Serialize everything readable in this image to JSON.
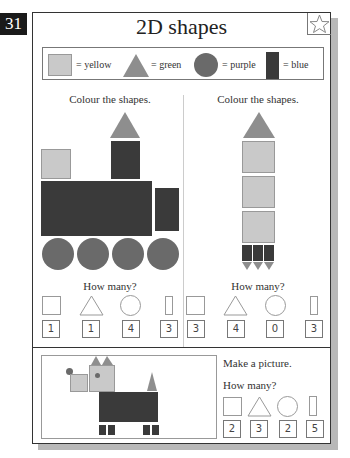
{
  "page_number": "31",
  "title": "2D shapes",
  "star_icon": "star-outline-icon",
  "key": {
    "items": [
      {
        "shape": "square",
        "label": "= yellow",
        "color": "#c9c9c9"
      },
      {
        "shape": "triangle",
        "label": "= green",
        "color": "#8e8e8e"
      },
      {
        "shape": "circle",
        "label": "= purple",
        "color": "#6a6a6a"
      },
      {
        "shape": "rectangle",
        "label": "= blue",
        "color": "#3a3a3a"
      }
    ]
  },
  "left_panel": {
    "instruction": "Colour the shapes.",
    "picture": "train",
    "how_many_label": "How many?",
    "answers": [
      "1",
      "1",
      "4",
      "3"
    ]
  },
  "right_panel": {
    "instruction": "Colour the shapes.",
    "picture": "rocket",
    "how_many_label": "How many?",
    "answers": [
      "3",
      "4",
      "0",
      "3"
    ]
  },
  "bottom_panel": {
    "instruction": "Make a picture.",
    "picture": "dog",
    "how_many_label": "How many?",
    "answers": [
      "2",
      "3",
      "2",
      "5"
    ]
  }
}
